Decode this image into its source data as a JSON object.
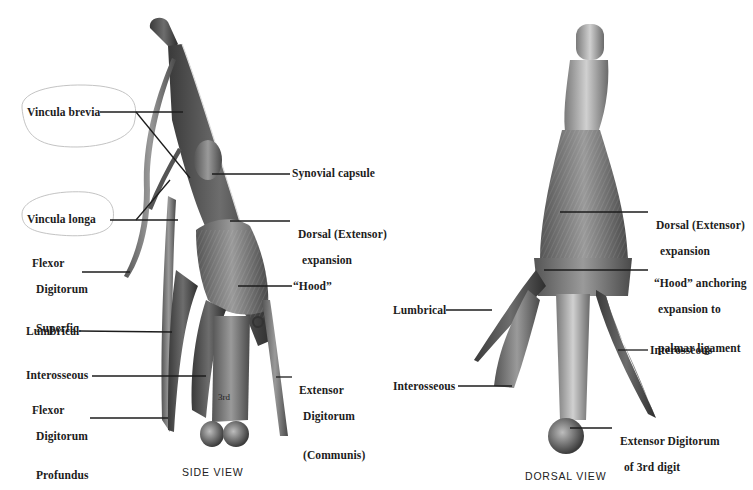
{
  "figure": {
    "background": "#ffffff",
    "ink_color": "#1c1c1c",
    "views": [
      {
        "id": "side",
        "caption": "SIDE VIEW",
        "labels": {
          "vincula_brevia": "Vincula brevia",
          "vincula_longa": "Vincula longa",
          "fds_1": "Flexor",
          "fds_2": "Digitorum",
          "fds_3": "Superfic.",
          "lumbrical": "Lumbrical",
          "interosseous": "Interosseous",
          "fdp_1": "Flexor",
          "fdp_2": "Digitorum",
          "fdp_3": "Profundus",
          "synovial_capsule": "Synovial capsule",
          "dorsal_expansion_1": "Dorsal (Extensor)",
          "dorsal_expansion_2": "expansion",
          "hood": "“Hood”",
          "edc_1": "Extensor",
          "edc_2": "Digitorum",
          "edc_3": "(Communis)",
          "bone_mark": "3rd"
        }
      },
      {
        "id": "dorsal",
        "caption": "DORSAL VIEW",
        "labels": {
          "dorsal_expansion_1": "Dorsal (Extensor)",
          "dorsal_expansion_2": "expansion",
          "hood_1": "“Hood” anchoring",
          "hood_2": "expansion to",
          "hood_3": "palmar ligament",
          "lumbrical": "Lumbrical",
          "interosseous_left": "Interosseous",
          "interosseous_right": "Interosseous",
          "edc3_1": "Extensor Digitorum",
          "edc3_2": "of 3rd digit"
        }
      }
    ]
  }
}
